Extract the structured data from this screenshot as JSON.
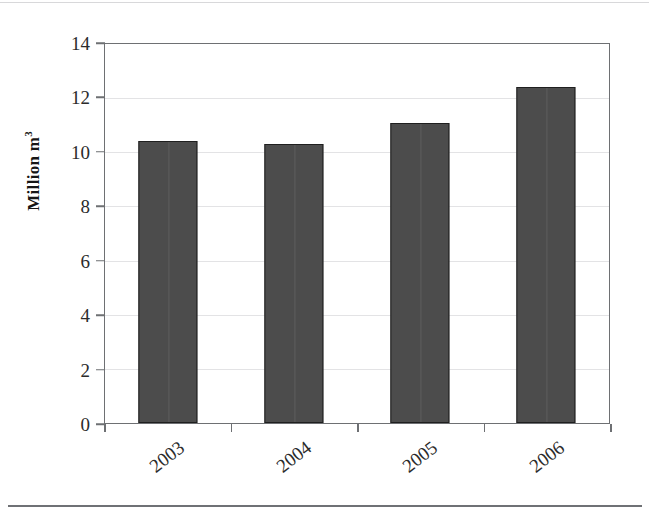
{
  "chart_data": {
    "type": "bar",
    "title": "",
    "subtitle": "",
    "categories": [
      "2003",
      "2004",
      "2005",
      "2006"
    ],
    "values": [
      10.4,
      10.3,
      11.1,
      12.4
    ],
    "series": [
      {
        "name": "",
        "values": [
          10.4,
          10.3,
          11.1,
          12.4
        ]
      }
    ],
    "xlabel": "",
    "ylabel": "Million m",
    "ylabel_superscript": "3",
    "ylim": [
      0,
      14
    ],
    "yticks": [
      0,
      2,
      4,
      6,
      8,
      10,
      12,
      14
    ],
    "ytick_labels": [
      "0",
      "2",
      "4",
      "6",
      "8",
      "10",
      "12",
      "14"
    ],
    "grid": "horizontal",
    "legend": "none",
    "annotations": [],
    "bar_color": "#4c4c4c",
    "bar_edge_color": "#1f1f1f",
    "grid_color": "#e3e3e5",
    "axis_color": "#6e7073",
    "xlabel_rotation": -38
  }
}
